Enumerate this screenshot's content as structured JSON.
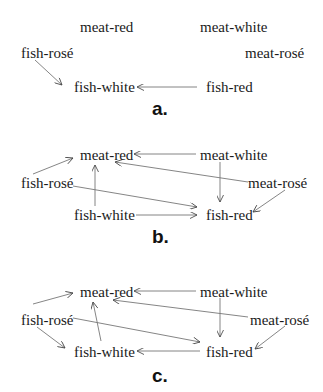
{
  "nodes": [
    "meat-red",
    "meat-white",
    "fish-rosé",
    "meat-rosé",
    "fish-white",
    "fish-red"
  ],
  "panels": [
    {
      "caption": "a.",
      "edges": [
        {
          "from": "fish-rosé",
          "to": "fish-white"
        },
        {
          "from": "fish-red",
          "to": "fish-white"
        }
      ]
    },
    {
      "caption": "b.",
      "edges": [
        {
          "from": "fish-rosé",
          "to": "meat-red"
        },
        {
          "from": "meat-white",
          "to": "meat-red"
        },
        {
          "from": "meat-rosé",
          "to": "meat-red"
        },
        {
          "from": "fish-white",
          "to": "meat-red"
        },
        {
          "from": "meat-white",
          "to": "fish-red"
        },
        {
          "from": "fish-rosé",
          "to": "fish-red"
        },
        {
          "from": "fish-white",
          "to": "fish-red"
        },
        {
          "from": "meat-rosé",
          "to": "fish-red"
        }
      ]
    },
    {
      "caption": "c.",
      "edges": [
        {
          "from": "fish-rosé",
          "to": "meat-red"
        },
        {
          "from": "meat-white",
          "to": "meat-red"
        },
        {
          "from": "meat-rosé",
          "to": "meat-red"
        },
        {
          "from": "fish-white",
          "to": "meat-red"
        },
        {
          "from": "meat-white",
          "to": "fish-red"
        },
        {
          "from": "fish-rosé",
          "to": "fish-red"
        },
        {
          "from": "fish-rosé",
          "to": "fish-white"
        },
        {
          "from": "fish-red",
          "to": "fish-white"
        },
        {
          "from": "meat-rosé",
          "to": "fish-red"
        }
      ]
    }
  ],
  "labels": {
    "meat_red": "meat-red",
    "meat_white": "meat-white",
    "fish_rose": "fish-rosé",
    "meat_rose": "meat-rosé",
    "fish_white": "fish-white",
    "fish_red": "fish-red"
  }
}
